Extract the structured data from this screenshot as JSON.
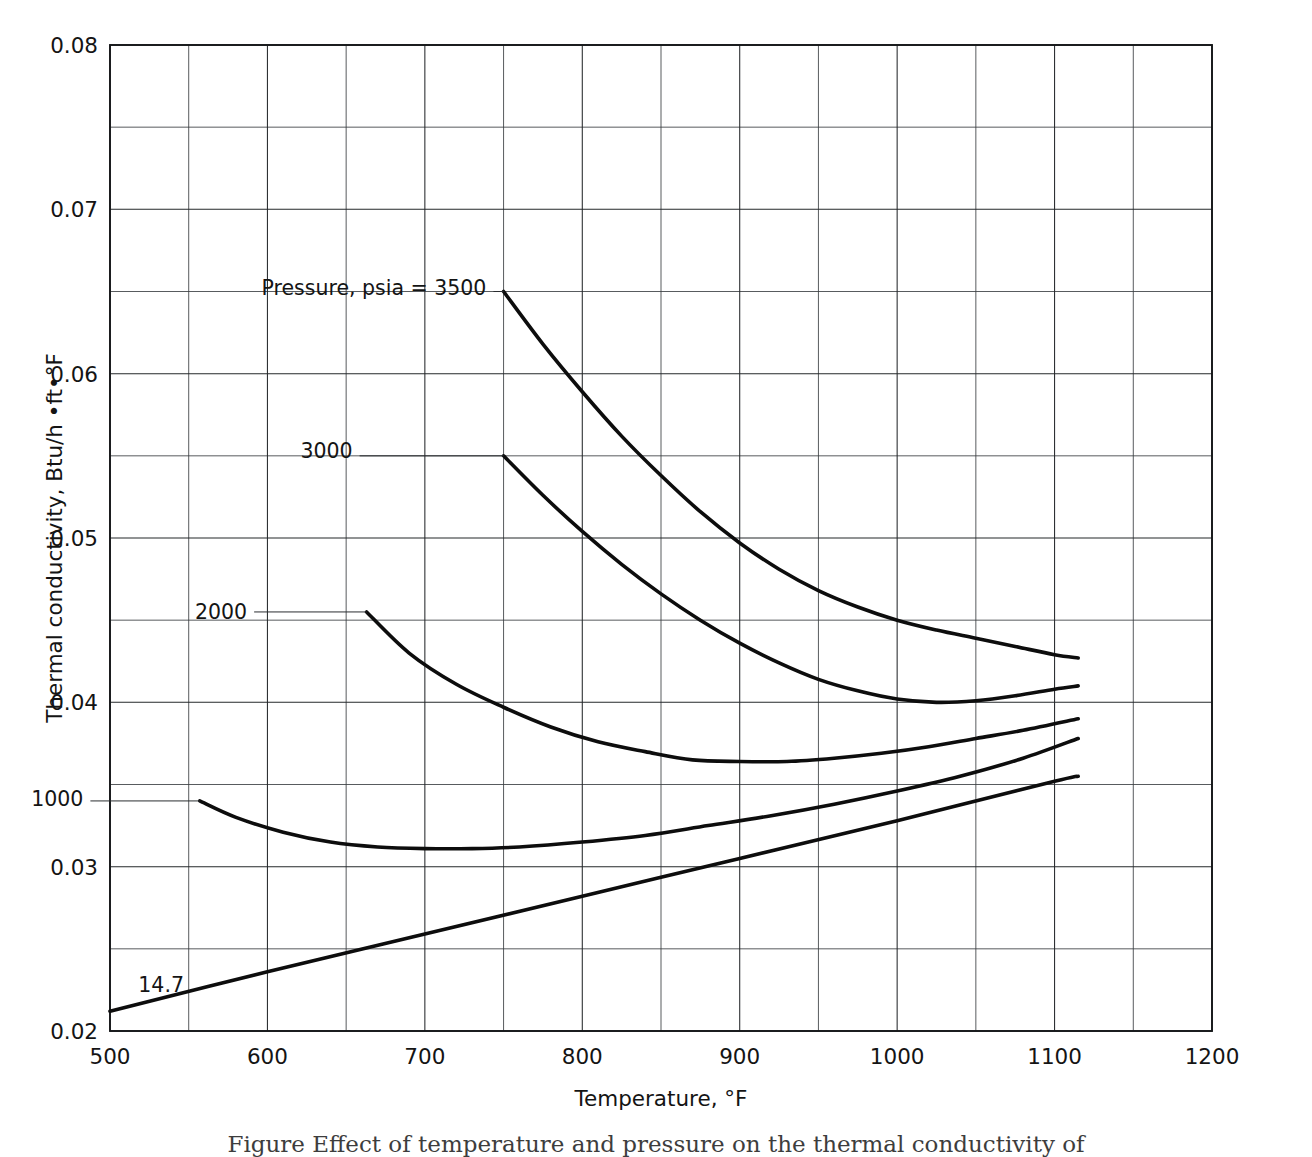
{
  "figure": {
    "caption": "Figure  Effect of temperature and pressure on the thermal conductivity of"
  },
  "chart_data": {
    "type": "line",
    "title": "",
    "xlabel": "Temperature, °F",
    "ylabel": "Thermal conductivity, Btu/h •ft•°F",
    "xlim": [
      500,
      1200
    ],
    "ylim": [
      0.02,
      0.08
    ],
    "xticks": [
      500,
      600,
      700,
      800,
      900,
      1000,
      1100,
      1200
    ],
    "xtick_labels": [
      "500",
      "600",
      "700",
      "800",
      "900",
      "1000",
      "1100",
      "1200"
    ],
    "yticks": [
      0.02,
      0.03,
      0.04,
      0.05,
      0.06,
      0.07,
      0.08
    ],
    "ytick_labels": [
      "0.02",
      "0.03",
      "0.04",
      "0.05",
      "0.06",
      "0.07",
      "0.08"
    ],
    "x_minor_step": 50,
    "y_minor_step": 0.005,
    "grid": true,
    "legend_position": "inline-labels",
    "series_label_prefix": "Pressure, psia = ",
    "series": [
      {
        "name": "3500",
        "label": "Pressure, psia = 3500",
        "label_x": 748,
        "label_y": 0.0652,
        "label_anchor": "end",
        "label_offset_x": -14,
        "leader_to_x": 750,
        "leader_to_y": 0.065,
        "x": [
          750,
          775,
          800,
          825,
          850,
          875,
          900,
          925,
          950,
          975,
          1000,
          1025,
          1050,
          1075,
          1100,
          1115
        ],
        "values": [
          0.065,
          0.0618,
          0.0589,
          0.0562,
          0.0538,
          0.0516,
          0.0497,
          0.0481,
          0.0468,
          0.0458,
          0.045,
          0.0444,
          0.0439,
          0.0434,
          0.0429,
          0.0427
        ]
      },
      {
        "name": "3000",
        "label": "3000",
        "label_x": 663,
        "label_y": 0.0553,
        "label_anchor": "end",
        "label_offset_x": -14,
        "leader_to_x": 750,
        "leader_to_y": 0.055,
        "x": [
          750,
          775,
          800,
          825,
          850,
          875,
          900,
          925,
          950,
          975,
          1000,
          1025,
          1050,
          1075,
          1100,
          1115
        ],
        "values": [
          0.055,
          0.0526,
          0.0504,
          0.0484,
          0.0466,
          0.045,
          0.0436,
          0.0424,
          0.0414,
          0.0407,
          0.0402,
          0.04,
          0.0401,
          0.0404,
          0.0408,
          0.041
        ]
      },
      {
        "name": "2000",
        "label": "2000",
        "label_x": 596,
        "label_y": 0.0455,
        "label_anchor": "end",
        "label_offset_x": -14,
        "leader_to_x": 663,
        "leader_to_y": 0.0455,
        "x": [
          663,
          690,
          720,
          750,
          780,
          810,
          840,
          870,
          900,
          930,
          960,
          990,
          1020,
          1050,
          1080,
          1115
        ],
        "values": [
          0.0455,
          0.043,
          0.0411,
          0.0397,
          0.0385,
          0.0376,
          0.037,
          0.0365,
          0.0364,
          0.0364,
          0.0366,
          0.0369,
          0.0373,
          0.0378,
          0.0383,
          0.039
        ]
      },
      {
        "name": "1000",
        "label": "1000",
        "label_x": 492,
        "label_y": 0.0341,
        "label_anchor": "end",
        "label_offset_x": -14,
        "leader_to_x": 557,
        "leader_to_y": 0.034,
        "x": [
          557,
          580,
          610,
          640,
          670,
          700,
          730,
          760,
          800,
          840,
          880,
          920,
          960,
          1000,
          1040,
          1080,
          1115
        ],
        "values": [
          0.034,
          0.033,
          0.0321,
          0.0315,
          0.0312,
          0.0311,
          0.0311,
          0.0312,
          0.0315,
          0.0319,
          0.0325,
          0.0331,
          0.0338,
          0.0346,
          0.0355,
          0.0366,
          0.0378
        ]
      },
      {
        "name": "14.7",
        "label": "14.7",
        "label_x": 518,
        "label_y": 0.0228,
        "label_anchor": "start",
        "label_offset_x": 0,
        "leader_to_x": null,
        "leader_to_y": null,
        "x": [
          500,
          600,
          700,
          800,
          900,
          1000,
          1100,
          1115
        ],
        "values": [
          0.0212,
          0.0236,
          0.0259,
          0.0282,
          0.0305,
          0.0328,
          0.0352,
          0.0355
        ]
      }
    ]
  }
}
